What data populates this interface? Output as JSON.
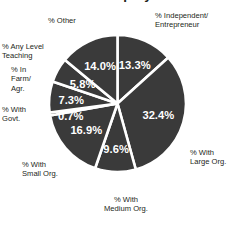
{
  "chart_data": {
    "type": "pie",
    "title": "Alumni Employment",
    "xlabel": "",
    "ylabel": "",
    "grid": false,
    "legend_position": "outside-labels",
    "units": "percent",
    "start_angle_deg": 0,
    "direction": "clockwise",
    "colors": {
      "slice_fill": "#3a3a3a",
      "slice_divider": "#ffffff",
      "value_text": "#ffffff",
      "label_text": "#231f20",
      "background": "#ffffff"
    },
    "categories": [
      "% Independent/\nEntrepreneur",
      "% With\nLarge Org.",
      "% With\nMedium Org.",
      "% With\nSmall Org.",
      "% With\nGovt.",
      "% In\nFarm/\nAgr.",
      "% Any Level\nTeaching",
      "% Other"
    ],
    "values": [
      13.3,
      32.4,
      9.6,
      16.9,
      0.7,
      7.3,
      5.8,
      14.0
    ],
    "value_labels": [
      "13.3%",
      "32.4%",
      "9.6%",
      "16.9%",
      "0.7%",
      "7.3%",
      "5.8%",
      "14.0%"
    ],
    "slices": [
      {
        "label": "% Independent/\nEntrepreneur",
        "label_line1": "% Independent/",
        "label_line2": "Entrepreneur",
        "value": 13.3,
        "value_label": "13.3%"
      },
      {
        "label": "% With\nLarge Org.",
        "label_line1": "% With",
        "label_line2": "Large Org.",
        "value": 32.4,
        "value_label": "32.4%"
      },
      {
        "label": "% With\nMedium Org.",
        "label_line1": "% With",
        "label_line2": "Medium Org.",
        "value": 9.6,
        "value_label": "9.6%"
      },
      {
        "label": "% With\nSmall Org.",
        "label_line1": "% With",
        "label_line2": "Small Org.",
        "value": 16.9,
        "value_label": "16.9%"
      },
      {
        "label": "% With\nGovt.",
        "label_line1": "% With",
        "label_line2": "Govt.",
        "value": 0.7,
        "value_label": "0.7%"
      },
      {
        "label": "% In\nFarm/\nAgr.",
        "label_line1": "% In",
        "label_line2": "Farm/",
        "label_line3": "Agr.",
        "value": 7.3,
        "value_label": "7.3%"
      },
      {
        "label": "% Any Level\nTeaching",
        "label_line1": "% Any Level",
        "label_line2": "Teaching",
        "value": 5.8,
        "value_label": "5.8%"
      },
      {
        "label": "% Other",
        "label_line1": "% Other",
        "value": 14.0,
        "value_label": "14.0%"
      }
    ]
  },
  "labels": {
    "independent": "% Independent/\nEntrepreneur",
    "large": "% With\nLarge Org.",
    "medium": "% With\nMedium Org.",
    "small": "% With\nSmall Org.",
    "govt": "% With\nGovt.",
    "farm": "% In\nFarm/\nAgr.",
    "teaching": "% Any Level\nTeaching",
    "other": "% Other"
  },
  "values": {
    "independent": "13.3%",
    "large": "32.4%",
    "medium": "9.6%",
    "small": "16.9%",
    "govt": "0.7%",
    "farm": "7.3%",
    "teaching": "5.8%",
    "other": "14.0%"
  }
}
